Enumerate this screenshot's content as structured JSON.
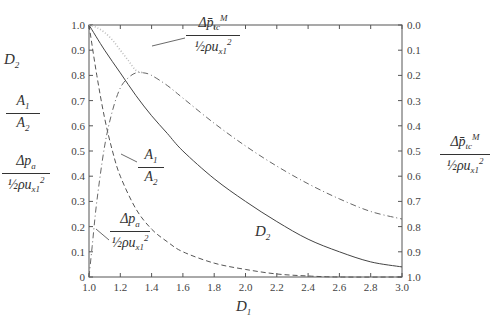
{
  "chart_data": {
    "type": "line",
    "title": "",
    "xlabel": "D1",
    "ylabel_left": [
      "D2",
      "A1/A2",
      "Δp_a / (½ρu_x1²)"
    ],
    "ylabel_right": "Δp̄_tc^M / (½ρu_x1²)",
    "xlim": [
      1.0,
      3.0
    ],
    "ylim_left": [
      0,
      1.0
    ],
    "ylim_right": [
      0.0,
      1.0
    ],
    "right_axis_inverted": true,
    "grid": false,
    "x_ticks": [
      "1.0",
      "1.2",
      "1.4",
      "1.6",
      "1.8",
      "2.0",
      "2.2",
      "2.4",
      "2.6",
      "2.8",
      "3.0"
    ],
    "y_ticks_left": [
      "0",
      "0.1",
      "0.2",
      "0.3",
      "0.4",
      "0.5",
      "0.6",
      "0.7",
      "0.8",
      "0.9",
      "1.0"
    ],
    "y_ticks_right": [
      "0.0",
      "0.1",
      "0.2",
      "0.3",
      "0.4",
      "0.5",
      "0.6",
      "0.7",
      "0.8",
      "0.9",
      "1.0"
    ],
    "series": [
      {
        "name": "D2",
        "style": "solid",
        "axis": "left",
        "x": [
          1.0,
          1.1,
          1.2,
          1.3,
          1.4,
          1.5,
          1.6,
          1.8,
          2.0,
          2.2,
          2.4,
          2.6,
          2.8,
          3.0
        ],
        "y": [
          1.0,
          0.9,
          0.81,
          0.72,
          0.64,
          0.57,
          0.5,
          0.39,
          0.3,
          0.22,
          0.15,
          0.1,
          0.06,
          0.04
        ]
      },
      {
        "name": "A1/A2",
        "style": "dashed",
        "axis": "left",
        "x": [
          1.0,
          1.05,
          1.1,
          1.15,
          1.2,
          1.3,
          1.4,
          1.5,
          1.6,
          1.8,
          2.0,
          2.2,
          2.4,
          2.6,
          3.0
        ],
        "y": [
          1.0,
          0.8,
          0.63,
          0.5,
          0.4,
          0.27,
          0.19,
          0.14,
          0.1,
          0.055,
          0.03,
          0.012,
          0.004,
          0.0,
          0.0
        ]
      },
      {
        "name": "Δp_a/(½ρu_x1²)",
        "style": "dash-dot",
        "axis": "left",
        "x": [
          1.0,
          1.02,
          1.05,
          1.1,
          1.15,
          1.2,
          1.25,
          1.3,
          1.35,
          1.4,
          1.5,
          1.6,
          1.8,
          2.0,
          2.2,
          2.4,
          2.6,
          2.8,
          3.0
        ],
        "y": [
          0.0,
          0.12,
          0.3,
          0.52,
          0.66,
          0.75,
          0.79,
          0.81,
          0.81,
          0.8,
          0.76,
          0.71,
          0.61,
          0.52,
          0.44,
          0.37,
          0.31,
          0.26,
          0.23
        ]
      },
      {
        "name": "Δp̄_tc^M/(½ρu_x1²)",
        "style": "dotted",
        "axis": "right",
        "x": [
          1.0,
          1.05,
          1.1,
          1.15,
          1.2,
          1.25,
          1.3,
          1.35
        ],
        "y": [
          0.0,
          0.01,
          0.03,
          0.06,
          0.1,
          0.14,
          0.18,
          0.19
        ]
      }
    ],
    "annotations": [
      {
        "text": "Δp̄_tc^M/(½ρu_x1²)",
        "points_to": "dotted curve near D1≈1.3"
      },
      {
        "text": "A1/A2",
        "points_to": "dashed curve near D1≈1.18"
      },
      {
        "text": "Δp_a/(½ρu_x1²)",
        "points_to": "dash-dot rising branch near D1≈1.03"
      },
      {
        "text": "D2",
        "points_to": "solid curve near D1≈2.1"
      }
    ]
  },
  "labels": {
    "x_axis": "D",
    "x_axis_sub": "1",
    "left_d2": "D",
    "left_d2_sub": "2",
    "a_num": "A",
    "a_num_sub": "1",
    "a_den": "A",
    "a_den_sub": "2",
    "dpa_num": "Δp",
    "dpa_num_sub": "a",
    "half": "½",
    "rho_u": "ρu",
    "u_sub": "x",
    "u_sub_sub": "1",
    "u_sup": "2",
    "dptc_num": "Δp̄",
    "dptc_sub": "t",
    "dptc_sub_sub": "c",
    "dptc_sup": "M",
    "curve_d2": "D",
    "curve_d2_sub": "2"
  }
}
